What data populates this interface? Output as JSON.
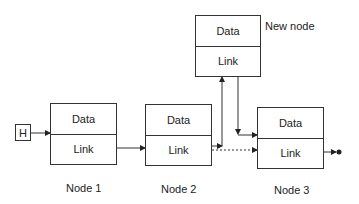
{
  "diagram": {
    "head": {
      "label": "H"
    },
    "nodes": [
      {
        "id": "node1",
        "data_label": "Data",
        "link_label": "Link",
        "caption": "Node 1"
      },
      {
        "id": "node2",
        "data_label": "Data",
        "link_label": "Link",
        "caption": "Node 2"
      },
      {
        "id": "new",
        "data_label": "Data",
        "link_label": "Link",
        "caption": "New node"
      },
      {
        "id": "node3",
        "data_label": "Data",
        "link_label": "Link",
        "caption": "Node 3"
      }
    ],
    "edges": [
      {
        "from": "head",
        "to": "node1",
        "style": "solid"
      },
      {
        "from": "node1",
        "to": "node2",
        "style": "solid"
      },
      {
        "from": "node2",
        "to": "new",
        "style": "solid"
      },
      {
        "from": "new",
        "to": "node3",
        "style": "solid"
      },
      {
        "from": "node2",
        "to": "node3",
        "style": "dotted",
        "note": "old link"
      },
      {
        "from": "node3",
        "to": "null",
        "style": "solid"
      }
    ],
    "colors": {
      "line": "#333333",
      "background": "#ffffff"
    }
  }
}
